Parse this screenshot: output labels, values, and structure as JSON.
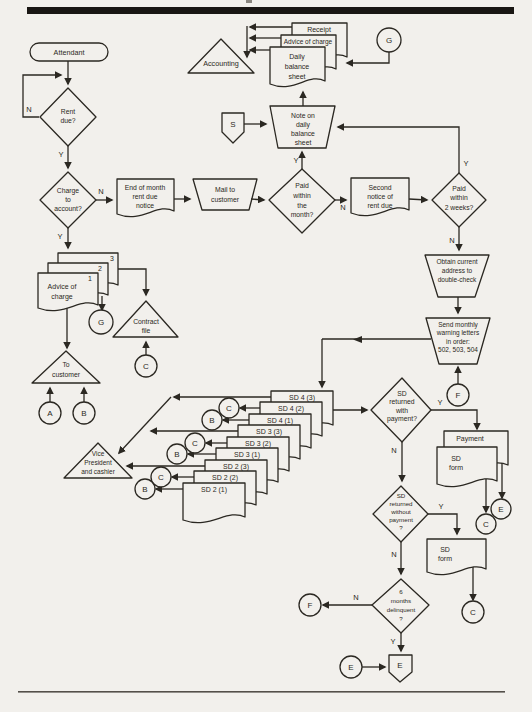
{
  "page": {
    "bg": "#f2f0ec",
    "ink": "#2b2822",
    "bar": "#191613"
  },
  "labels": {
    "yes": "Y",
    "no": "N"
  },
  "connectors": {
    "a": "A",
    "b": "B",
    "c": "C",
    "e": "E",
    "f": "F",
    "g": "G",
    "s": "S"
  },
  "nodes": {
    "attendant": {
      "label": "Attendant"
    },
    "rent_due": {
      "l1": "Rent",
      "l2": "due?"
    },
    "charge": {
      "l1": "Charge",
      "l2": "to",
      "l3": "account?"
    },
    "eom_notice": {
      "l1": "End of month",
      "l2": "rent due",
      "l3": "notice"
    },
    "mail": {
      "l1": "Mail to",
      "l2": "customer"
    },
    "paid_month": {
      "l1": "Paid",
      "l2": "within",
      "l3": "the",
      "l4": "month?"
    },
    "second_notice": {
      "l1": "Second",
      "l2": "notice of",
      "l3": "rent due"
    },
    "paid_2wk": {
      "l1": "Paid",
      "l2": "within",
      "l3": "2 weeks?"
    },
    "note_daily": {
      "l1": "Note on",
      "l2": "daily",
      "l3": "balance",
      "l4": "sheet"
    },
    "receipt": {
      "label": "Receipt"
    },
    "advice_top": {
      "label": "Advice of charge"
    },
    "daily_sheet": {
      "l1": "Daily",
      "l2": "balance",
      "l3": "sheet"
    },
    "accounting": {
      "label": "Accounting"
    },
    "advice_copies": {
      "n1": "1",
      "n2": "2",
      "n3": "3",
      "l1": "Advice of",
      "l2": "charge"
    },
    "contract_file": {
      "l1": "Contract",
      "l2": "file"
    },
    "to_customer": {
      "l1": "To",
      "l2": "customer"
    },
    "obtain": {
      "l1": "Obtain current",
      "l2": "address to",
      "l3": "double-check"
    },
    "send": {
      "l1": "Send monthly",
      "l2": "warning letters",
      "l3": "in order:",
      "l4": "502, 503, 504"
    },
    "vp": {
      "l1": "Vice",
      "l2": "President",
      "l3": "and cashier"
    },
    "sd_with": {
      "l1": "SD",
      "l2": "returned",
      "l3": "with",
      "l4": "payment?"
    },
    "payment": {
      "label": "Payment"
    },
    "sd_form1": {
      "l1": "SD",
      "l2": "form"
    },
    "sd_without": {
      "l1": "SD",
      "l2": "returned",
      "l3": "without",
      "l4": "payment",
      "l5": "?"
    },
    "sd_form2": {
      "l1": "SD",
      "l2": "form"
    },
    "six_months": {
      "l1": "6",
      "l2": "months",
      "l3": "delinquent",
      "l4": "?"
    },
    "exit_e": {
      "label": "E"
    }
  },
  "sd_stack": [
    "SD 4 (3)",
    "SD 4 (2)",
    "SD 4 (1)",
    "SD 3 (3)",
    "SD 3 (2)",
    "SD 3 (1)",
    "SD 2 (3)",
    "SD 2 (2)",
    "SD 2 (1)"
  ]
}
